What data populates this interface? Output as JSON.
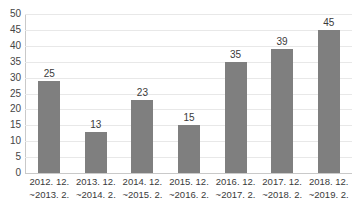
{
  "chart_data": {
    "type": "bar",
    "title": "",
    "subtitle": "",
    "xlabel": "",
    "ylabel": "",
    "ylim": [
      0,
      50
    ],
    "grid": true,
    "legend": false,
    "legend_position": "none",
    "orientation": "vertical",
    "bar_color": "#7f7f7f",
    "gridline_color": "#e8e8e8",
    "axis_color": "#c9c9c9",
    "yticks": [
      50,
      45,
      40,
      35,
      30,
      25,
      20,
      15,
      10,
      5,
      0
    ],
    "categories": [
      "2012. 12.\n~2013. 2.",
      "2013. 12.\n~2014. 2.",
      "2014. 12.\n~2015. 2.",
      "2015. 12.\n~2016. 2.",
      "2016. 12.\n~2017. 2.",
      "2017. 12.\n~2018. 2.",
      "2018. 12.\n~2019. 2."
    ],
    "category_lines": [
      {
        "line1": "2012. 12.",
        "line2": "~2013. 2."
      },
      {
        "line1": "2013. 12.",
        "line2": "~2014. 2."
      },
      {
        "line1": "2014. 12.",
        "line2": "~2015. 2."
      },
      {
        "line1": "2015. 12.",
        "line2": "~2016. 2."
      },
      {
        "line1": "2016. 12.",
        "line2": "~2017. 2."
      },
      {
        "line1": "2017. 12.",
        "line2": "~2018. 2."
      },
      {
        "line1": "2018. 12.",
        "line2": "~2019. 2."
      }
    ],
    "values": [
      25,
      13,
      23,
      15,
      35,
      39,
      45
    ],
    "data_labels": [
      "25",
      "13",
      "23",
      "15",
      "35",
      "39",
      "45"
    ],
    "drawn_heights": [
      29,
      13,
      23,
      15,
      35,
      39,
      45
    ]
  }
}
